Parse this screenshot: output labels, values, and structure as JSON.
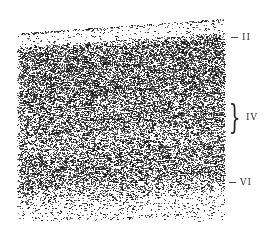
{
  "figure": {
    "labels": [
      {
        "id": "II",
        "text": "II",
        "tick": true,
        "y": 38
      },
      {
        "id": "IV",
        "text": "IV",
        "brace": true,
        "y": 117
      },
      {
        "id": "VI",
        "text": "VI",
        "tick": true,
        "y": 183
      }
    ]
  }
}
